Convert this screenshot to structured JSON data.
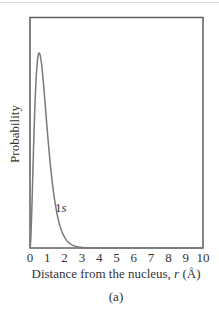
{
  "chart_data": {
    "type": "line",
    "title": "",
    "caption": "(a)",
    "xlabel": "Distance from the nucleus, r (Å)",
    "xlabel_parts": {
      "prefix": "Distance from the nucleus, ",
      "var": "r",
      "suffix": " (Å)"
    },
    "ylabel": "Probability",
    "xlim": [
      0,
      10
    ],
    "ylim": [
      0,
      1.1
    ],
    "x_ticks": [
      "0",
      "1",
      "2",
      "3",
      "4",
      "5",
      "6",
      "7",
      "8",
      "9",
      "10"
    ],
    "y_ticks": [],
    "grid": false,
    "legend": null,
    "series": [
      {
        "name": "1s",
        "label_parts": {
          "n": "1",
          "l": "s"
        },
        "color": "#7a7a7a",
        "description": "Radial probability distribution of hydrogen 1s orbital, peak near r ≈ 0.53 Å",
        "x": [
          0,
          0.1,
          0.2,
          0.3,
          0.4,
          0.53,
          0.6,
          0.8,
          1.0,
          1.2,
          1.4,
          1.6,
          1.8,
          2.0,
          2.5,
          3.0,
          3.5,
          4.0,
          5.0,
          6.0,
          7.0,
          8.0,
          9.0,
          10.0
        ],
        "values": [
          0,
          0.17,
          0.48,
          0.78,
          0.95,
          1.0,
          0.99,
          0.87,
          0.68,
          0.49,
          0.34,
          0.22,
          0.14,
          0.09,
          0.027,
          0.007,
          0.002,
          0.0005,
          0,
          0,
          0,
          0,
          0,
          0
        ]
      }
    ],
    "annotations": [
      {
        "text": "1s",
        "x": 1.5,
        "y": 0.26
      }
    ]
  },
  "colors": {
    "frame": "#5e5e5e",
    "curve": "#7a7a7a",
    "text": "#333333",
    "top_rule": "#d6d6d6"
  }
}
